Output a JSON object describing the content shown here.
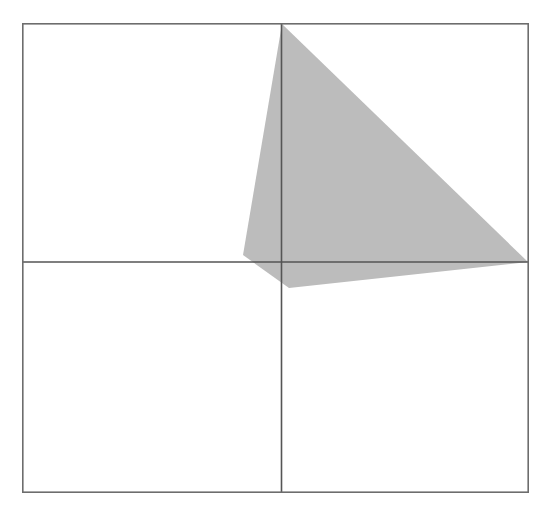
{
  "figure": {
    "title": "Shaded quadrilateral region in a bordered square with crossed axis lines",
    "canvas": {
      "width": 549,
      "height": 517,
      "background": "#ffffff"
    },
    "frame": {
      "name": "outer-square-border",
      "x": 22,
      "y": 23,
      "width": 507,
      "height": 470,
      "stroke": "#6d6d6d",
      "stroke_width": 1.6,
      "fill": "none"
    },
    "axes": {
      "vertical_line": {
        "label": "vertical axis line",
        "x": 281.5,
        "y1": 23,
        "y2": 493,
        "stroke": "#555555",
        "stroke_width": 1.6
      },
      "horizontal_line": {
        "label": "horizontal axis line",
        "y": 262.0,
        "x1": 22,
        "x2": 529,
        "stroke": "#555555",
        "stroke_width": 1.6
      },
      "origin": {
        "x": 281.5,
        "y": 262.0
      }
    },
    "shape": {
      "name": "shaded-quadrilateral",
      "type": "polygon",
      "fill": "#bcbcbc",
      "fill_opacity": 1,
      "stroke": "none",
      "vertices": [
        {
          "label": "apex-top",
          "x": 282,
          "y": 24
        },
        {
          "label": "vertex-right",
          "x": 528,
          "y": 262
        },
        {
          "label": "vertex-bottom",
          "x": 289,
          "y": 288
        },
        {
          "label": "vertex-left",
          "x": 243,
          "y": 255
        }
      ],
      "points_string": "282,24 528,262 289,288 243,255"
    },
    "quadrants": [
      {
        "name": "top-left-quadrant",
        "shaded": false
      },
      {
        "name": "top-right-quadrant",
        "shaded": true
      },
      {
        "name": "bottom-left-quadrant",
        "shaded": false
      },
      {
        "name": "bottom-right-quadrant",
        "shaded": true
      }
    ]
  }
}
